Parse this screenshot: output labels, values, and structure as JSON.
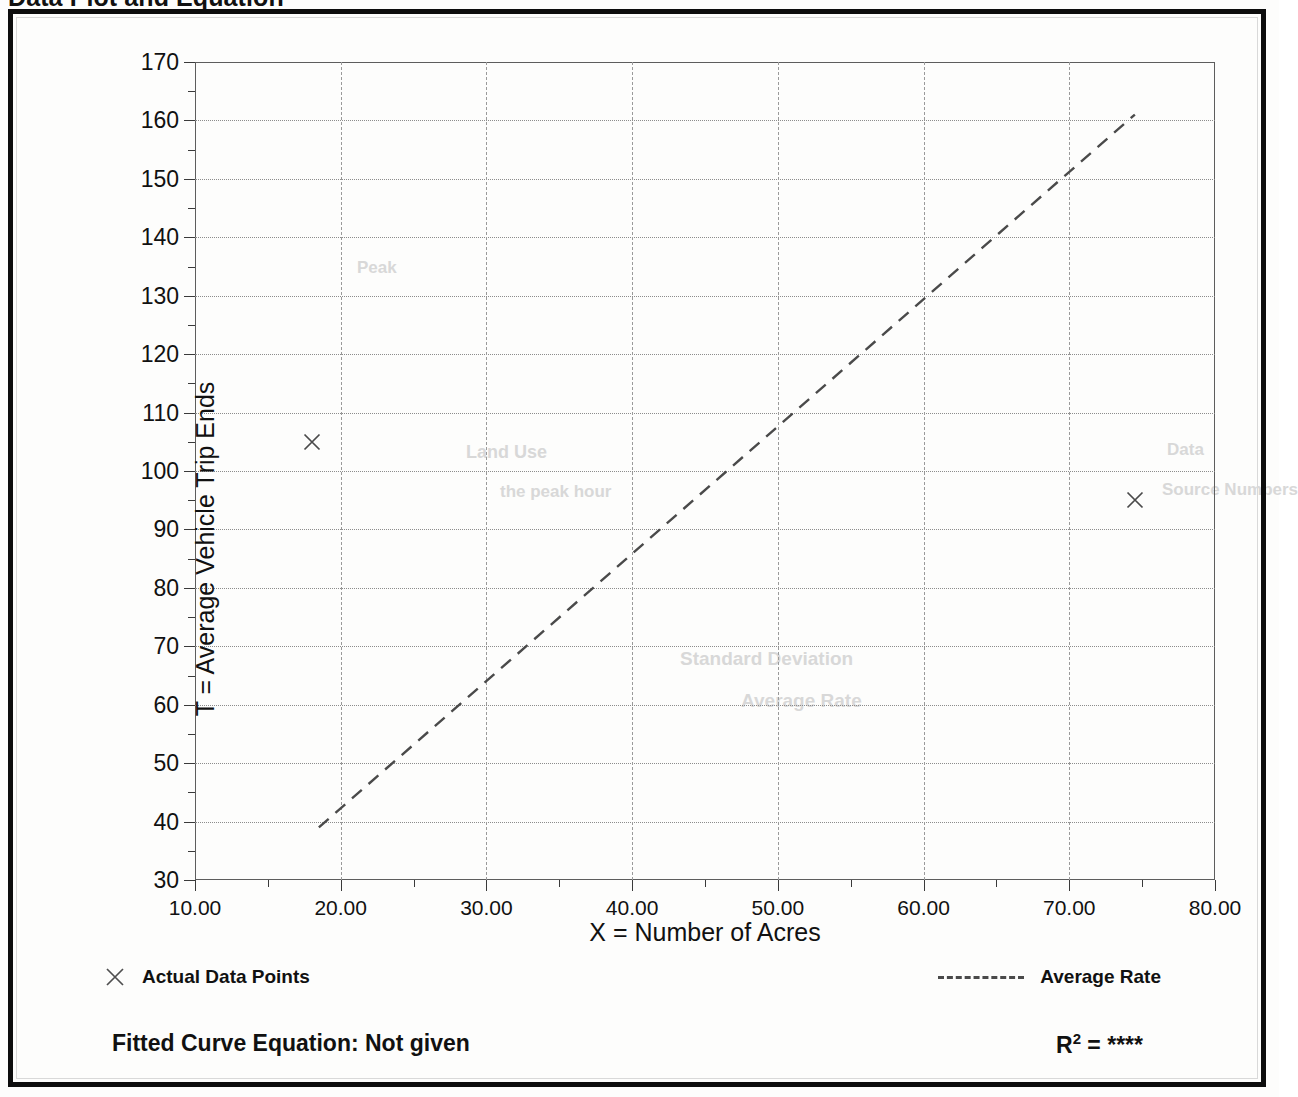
{
  "document": {
    "title": "Data Plot and Equation"
  },
  "chart_data": {
    "type": "scatter",
    "title": "Data Plot and Equation",
    "xlabel": "X = Number of Acres",
    "ylabel": "T = Average Vehicle Trip Ends",
    "xlim": [
      10,
      80
    ],
    "ylim": [
      30,
      170
    ],
    "x_tick_step": 10,
    "y_tick_step": 10,
    "x_minor_step": 5,
    "y_minor_step": 5,
    "grid": true,
    "x_ticks": [
      "10.00",
      "20.00",
      "30.00",
      "40.00",
      "50.00",
      "60.00",
      "70.00",
      "80.00"
    ],
    "y_ticks": [
      "30",
      "40",
      "50",
      "60",
      "70",
      "80",
      "90",
      "100",
      "110",
      "120",
      "130",
      "140",
      "150",
      "160",
      "170"
    ],
    "legend_position": "below-axes",
    "series": [
      {
        "name": "Actual Data Points",
        "type": "scatter",
        "marker": "x",
        "points": [
          {
            "x": 18.0,
            "y": 105
          },
          {
            "x": 74.5,
            "y": 95
          }
        ]
      },
      {
        "name": "Average Rate",
        "type": "line",
        "style": "dashed",
        "points": [
          {
            "x": 18.5,
            "y": 39
          },
          {
            "x": 74.5,
            "y": 161
          }
        ]
      }
    ],
    "annotations": {
      "fitted_curve_equation": "Fitted Curve Equation:  Not given",
      "r_squared_label": "R",
      "r_squared_exponent": "2",
      "r_squared_equals": " = ",
      "r_squared_value": "****"
    }
  },
  "legend": {
    "actual_data_points": "Actual Data Points",
    "average_rate": "Average Rate",
    "marker_icon": "x-marker-icon",
    "line_icon": "dashed-line-icon"
  },
  "footer": {
    "equation": "Fitted Curve Equation:  Not given",
    "r_label": "R",
    "r_sup": "2",
    "r_eq": " = ",
    "r_value": "****"
  },
  "artifacts": {
    "bleed_1": "Peak",
    "bleed_2": "Land Use",
    "bleed_3": "the peak hour",
    "bleed_4": "Data",
    "bleed_5": "Source Numbers",
    "bleed_6": "Average Rate",
    "bleed_7": "Standard Deviation"
  }
}
